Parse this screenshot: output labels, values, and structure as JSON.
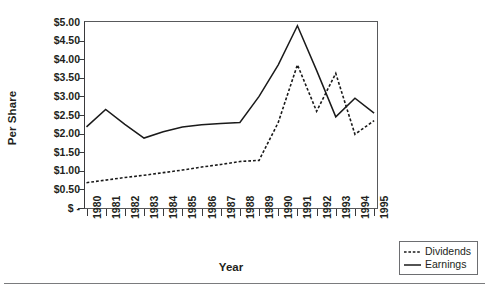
{
  "chart_data": {
    "type": "line",
    "title": "",
    "xlabel": "Year",
    "ylabel": "Per Share",
    "categories": [
      1980,
      1981,
      1982,
      1983,
      1984,
      1985,
      1986,
      1987,
      1988,
      1989,
      1990,
      1991,
      1992,
      1993,
      1994,
      1995
    ],
    "x_tick_labels": [
      "1980",
      "1981",
      "1982",
      "1983",
      "1984",
      "1985",
      "1986",
      "1987",
      "1988",
      "1989",
      "1990",
      "1991",
      "1992",
      "1993",
      "1994",
      "1995"
    ],
    "y_tick_labels": [
      "$5.00",
      "$4.50",
      "$4.00",
      "$3.50",
      "$3.00",
      "$2.50",
      "$2.00",
      "$1.50",
      "$1.00",
      "$0.50",
      "$ -"
    ],
    "y_tick_values": [
      5.0,
      4.5,
      4.0,
      3.5,
      3.0,
      2.5,
      2.0,
      1.5,
      1.0,
      0.5,
      0.0
    ],
    "ylim": [
      0,
      5.0
    ],
    "grid": false,
    "legend_position": "outside-bottom-right",
    "series": [
      {
        "name": "Dividends",
        "style": "dotted",
        "color": "#1a1a1a",
        "values": [
          0.68,
          0.75,
          0.82,
          0.88,
          0.95,
          1.02,
          1.1,
          1.17,
          1.25,
          1.28,
          2.3,
          3.85,
          2.6,
          3.62,
          1.98,
          2.35
        ]
      },
      {
        "name": "Earnings",
        "style": "solid",
        "color": "#1a1a1a",
        "values": [
          2.18,
          2.65,
          2.25,
          1.88,
          2.05,
          2.18,
          2.24,
          2.27,
          2.3,
          3.0,
          3.85,
          4.9,
          3.7,
          2.45,
          2.95,
          2.55
        ]
      }
    ]
  },
  "legend": {
    "items": [
      {
        "label": "Dividends",
        "style": "dotted"
      },
      {
        "label": "Earnings",
        "style": "solid"
      }
    ]
  },
  "axis": {
    "y_title": "Per Share",
    "x_title": "Year"
  }
}
